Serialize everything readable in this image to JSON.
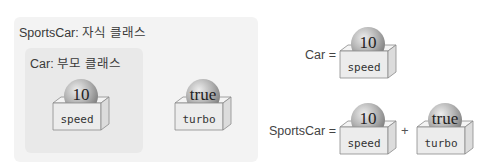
{
  "left_panel": {
    "outer_title": "SportsCar: 자식 클래스",
    "inner_title": "Car: 부모 클래스",
    "items": [
      {
        "value": "10",
        "field": "speed"
      },
      {
        "value": "true",
        "field": "turbo"
      }
    ]
  },
  "right_panel": {
    "car_equation": {
      "label": "Car =",
      "items": [
        {
          "value": "10",
          "field": "speed"
        }
      ]
    },
    "sportscar_equation": {
      "label": "SportsCar =",
      "operator": "+",
      "items": [
        {
          "value": "10",
          "field": "speed"
        },
        {
          "value": "true",
          "field": "turbo"
        }
      ]
    }
  },
  "colors": {
    "outer_panel_bg": "#f3f3f3",
    "inner_panel_bg": "#e9e9e9",
    "box_face": "#ececec",
    "box_edge": "#8a8a8a",
    "ball_light": "#e6e6e6",
    "ball_dark": "#8c8c8c"
  }
}
